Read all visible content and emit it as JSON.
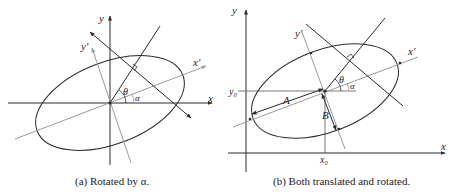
{
  "panels": [
    {
      "id": "a",
      "caption": "(a) Rotated by α.",
      "labels": {
        "x": "x",
        "y": "y",
        "xp": "x′",
        "yp": "y′",
        "theta": "θ",
        "alpha": "α"
      }
    },
    {
      "id": "b",
      "caption": "(b) Both translated and rotated.",
      "labels": {
        "x": "x",
        "y": "y",
        "xp": "x′",
        "yp": "y′",
        "theta": "θ",
        "alpha": "α",
        "A": "A",
        "B": "B",
        "x0": "x₀",
        "y0": "y₀"
      }
    }
  ],
  "colors": {
    "ink": "#2a2a2a",
    "gray": "#9a9a9a"
  }
}
